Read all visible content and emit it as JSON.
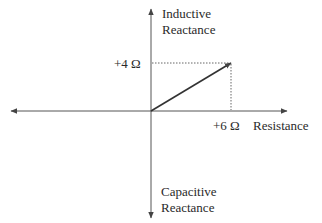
{
  "diagram": {
    "axes": {
      "y_positive_label_line1": "Inductive",
      "y_positive_label_line2": "Reactance",
      "y_negative_label_line1": "Capacitive",
      "y_negative_label_line2": "Reactance",
      "x_positive_label": "Resistance"
    },
    "ticks": {
      "reactance_value": "+4 Ω",
      "resistance_value": "+6 Ω"
    },
    "vector": {
      "resistance": 6,
      "reactance": 4,
      "unit": "Ω"
    },
    "colors": {
      "axis": "#555555",
      "vector": "#333333",
      "guide": "#555555",
      "text": "#2a2a2a"
    }
  }
}
